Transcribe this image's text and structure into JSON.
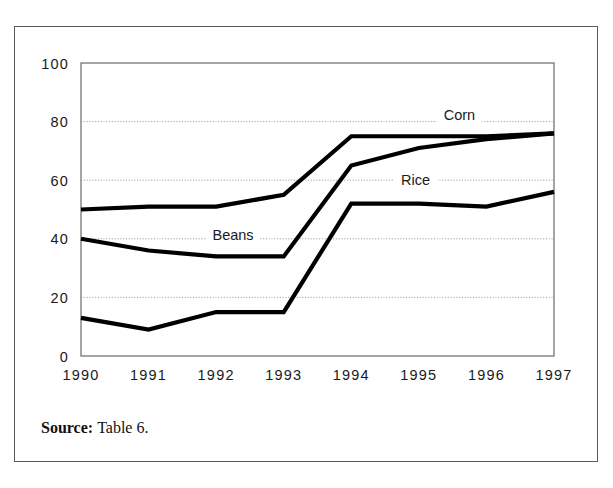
{
  "figure": {
    "source_label": "Source:",
    "source_text": "Table 6."
  },
  "chart_data": {
    "type": "line",
    "title": "",
    "xlabel": "",
    "ylabel": "",
    "categories": [
      "1990",
      "1991",
      "1992",
      "1993",
      "1994",
      "1995",
      "1996",
      "1997"
    ],
    "x": [
      1990,
      1991,
      1992,
      1993,
      1994,
      1995,
      1996,
      1997
    ],
    "ylim": [
      0,
      100
    ],
    "yticks": [
      0,
      20,
      40,
      60,
      80,
      100
    ],
    "ytick_labels": [
      "0",
      "20",
      "40",
      "60",
      "80",
      "100"
    ],
    "grid": true,
    "grid_axis": "y",
    "legend_position": "inline-annotations",
    "line_color": "#000000",
    "series": [
      {
        "name": "Corn",
        "values": [
          50,
          51,
          51,
          55,
          75,
          75,
          75,
          76
        ],
        "label": "Corn",
        "label_x": 1995.6,
        "label_y": 80.5
      },
      {
        "name": "Beans",
        "values": [
          40,
          36,
          34,
          34,
          65,
          71,
          74,
          76
        ],
        "label": "Beans",
        "label_x": 1992.25,
        "label_y": 39.5
      },
      {
        "name": "Rice",
        "values": [
          13,
          9,
          15,
          15,
          52,
          52,
          51,
          56
        ],
        "label": "Rice",
        "label_x": 1994.95,
        "label_y": 58.5
      }
    ]
  }
}
